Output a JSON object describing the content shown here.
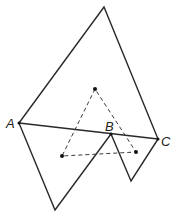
{
  "diagram": {
    "labels": {
      "A": "A",
      "B": "B",
      "C": "C"
    },
    "colors": {
      "line": "#2a2a2a",
      "background": "#ffffff"
    }
  }
}
